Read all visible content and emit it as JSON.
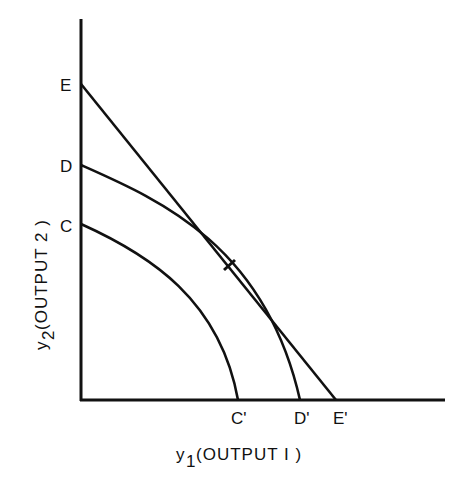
{
  "diagram": {
    "type": "production-possibility-frontier",
    "x_axis_label_var": "y",
    "x_axis_label_sub": "1",
    "x_axis_label_text": " (OUTPUT I )",
    "y_axis_label_var": "y",
    "y_axis_label_sub": "2",
    "y_axis_label_text": "(OUTPUT 2 )",
    "y_intercept_labels": [
      "E",
      "D",
      "C"
    ],
    "x_intercept_labels": [
      "C'",
      "D'",
      "E'"
    ],
    "curves": [
      {
        "name": "CC'",
        "type": "concave-frontier",
        "from": "C",
        "to": "C'"
      },
      {
        "name": "DD'",
        "type": "concave-frontier",
        "from": "D",
        "to": "D'"
      },
      {
        "name": "EE'",
        "type": "straight-line",
        "from": "E",
        "to": "E'",
        "tangent_to": "DD'"
      }
    ],
    "tangent_mark": "tick at tangency of EE' and DD'"
  }
}
